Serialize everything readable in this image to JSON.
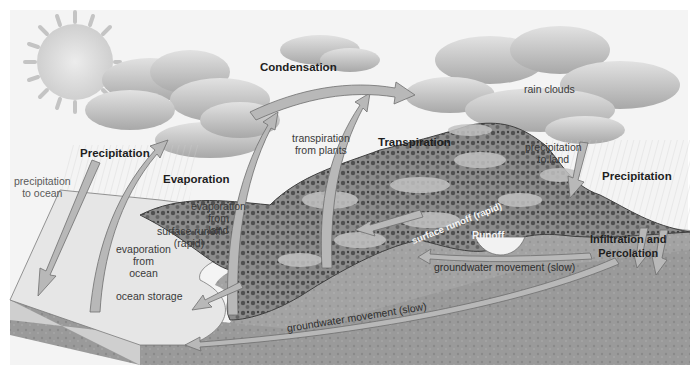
{
  "diagram": {
    "palette": {
      "sky": "#f4f4f4",
      "cloud": "#c9c9c9",
      "cloud_shadow": "#9c9c9c",
      "sun": "#d8d8d8",
      "ocean_top": "#e6e6e6",
      "ocean_side": "#cfcfcf",
      "ground": "#9a9a9a",
      "ground_dark": "#858585",
      "hills": "#b4b4b4",
      "vegetation": "#5a5a5a",
      "arrow_fill": "#b8b8b8",
      "arrow_stroke": "#6e6e6e"
    },
    "labels": {
      "condensation": "Condensation",
      "rain_clouds": "rain clouds",
      "precipitation_left": "Precipitation",
      "precipitation_to_ocean_1": "precipitation",
      "precipitation_to_ocean_2": "to ocean",
      "evaporation": "Evaporation",
      "evaporation_from_land_1": "evaporation",
      "evaporation_from_land_2": "from",
      "evaporation_from_land_3": "land",
      "evaporation_from_ocean_1": "evaporation",
      "evaporation_from_ocean_2": "from",
      "evaporation_from_ocean_3": "ocean",
      "transpiration_from_plants_1": "transpiration",
      "transpiration_from_plants_2": "from plants",
      "transpiration": "Transpiration",
      "precipitation_to_land_1": "precipitation",
      "precipitation_to_land_2": "to land",
      "precipitation_right": "Precipitation",
      "surface_runoff_rapid_hill": "surface runoff (rapid)",
      "runoff": "Runoff",
      "surface_runoff_1": "surface runoff",
      "surface_runoff_2": "(rapid)",
      "ocean_storage": "ocean storage",
      "infiltration_1": "Infiltration and",
      "infiltration_2": "Percolation",
      "groundwater_upper": "groundwater movement (slow)",
      "groundwater_lower": "groundwater movement (slow)"
    }
  }
}
